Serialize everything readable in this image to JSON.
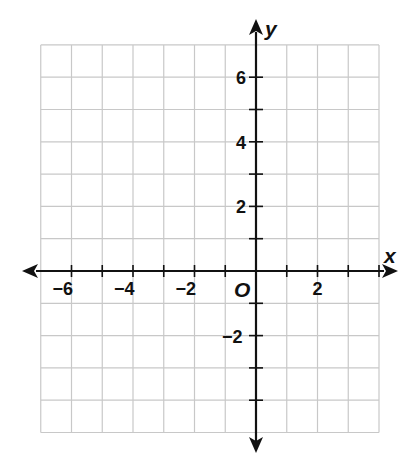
{
  "chart_data": {
    "type": "coordinate-grid",
    "title": "",
    "xlabel": "x",
    "ylabel": "y",
    "origin_label": "O",
    "xlim": [
      -7,
      4
    ],
    "ylim": [
      -5,
      7
    ],
    "grid": true,
    "grid_step": 1,
    "x_tick_labels": [
      "−6",
      "−4",
      "−2",
      "2"
    ],
    "x_tick_values": [
      -6,
      -4,
      -2,
      2
    ],
    "y_tick_labels": [
      "6",
      "4",
      "2",
      "−2"
    ],
    "y_tick_values": [
      6,
      4,
      2,
      -2
    ],
    "series": []
  },
  "colors": {
    "grid": "#c8c8c8",
    "axis": "#111111",
    "text": "#111111"
  }
}
